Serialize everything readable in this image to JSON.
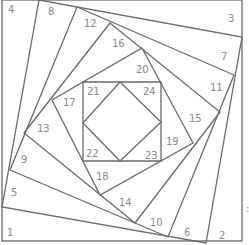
{
  "diagram": {
    "outer_square": {
      "x1": 2,
      "y1": 0,
      "x2": 242,
      "y2": 241
    },
    "spiral_levels": [
      {
        "points": [
          [
            39,
            0
          ],
          [
            242,
            37
          ],
          [
            206,
            243
          ],
          [
            2,
            207
          ]
        ]
      },
      {
        "points": [
          [
            77,
            7
          ],
          [
            234,
            75
          ],
          [
            168,
            237
          ],
          [
            10,
            170
          ]
        ]
      },
      {
        "points": [
          [
            110,
            23
          ],
          [
            220,
            112
          ],
          [
            135,
            223
          ],
          [
            24,
            133
          ]
        ]
      },
      {
        "points": [
          [
            142,
            48
          ],
          [
            193,
            143
          ],
          [
            100,
            195
          ],
          [
            52,
            100
          ]
        ]
      },
      {
        "points": [
          [
            161,
            82
          ],
          [
            161,
            161
          ],
          [
            83,
            161
          ],
          [
            83,
            82
          ]
        ]
      }
    ],
    "diamond": {
      "points": [
        [
          120,
          82
        ],
        [
          161,
          122
        ],
        [
          120,
          161
        ],
        [
          83,
          123
        ]
      ]
    },
    "labels": [
      {
        "text": "1",
        "x": 7,
        "y": 236
      },
      {
        "text": "2",
        "x": 219,
        "y": 239
      },
      {
        "text": "3",
        "x": 228,
        "y": 22
      },
      {
        "text": "4",
        "x": 8,
        "y": 13
      },
      {
        "text": "5",
        "x": 11,
        "y": 196
      },
      {
        "text": "6",
        "x": 184,
        "y": 236
      },
      {
        "text": "7",
        "x": 221,
        "y": 60
      },
      {
        "text": "8",
        "x": 48,
        "y": 15
      },
      {
        "text": "9",
        "x": 21,
        "y": 163
      },
      {
        "text": "10",
        "x": 150,
        "y": 226
      },
      {
        "text": "11",
        "x": 210,
        "y": 91
      },
      {
        "text": "12",
        "x": 84,
        "y": 27
      },
      {
        "text": "13",
        "x": 37,
        "y": 132
      },
      {
        "text": "14",
        "x": 119,
        "y": 206
      },
      {
        "text": "15",
        "x": 189,
        "y": 122
      },
      {
        "text": "16",
        "x": 112,
        "y": 47
      },
      {
        "text": "17",
        "x": 63,
        "y": 106
      },
      {
        "text": "18",
        "x": 96,
        "y": 180
      },
      {
        "text": "19",
        "x": 166,
        "y": 145
      },
      {
        "text": "20",
        "x": 136,
        "y": 73
      },
      {
        "text": "21",
        "x": 87,
        "y": 95
      },
      {
        "text": "22",
        "x": 86,
        "y": 157
      },
      {
        "text": "23",
        "x": 145,
        "y": 159
      },
      {
        "text": "24",
        "x": 143,
        "y": 95
      }
    ],
    "side_marks": [
      {
        "text": ":",
        "x": 246,
        "y": 212
      }
    ],
    "colors": {
      "line": "#6a6a6a",
      "label": "#8a8a8a",
      "background": "#ffffff"
    }
  }
}
